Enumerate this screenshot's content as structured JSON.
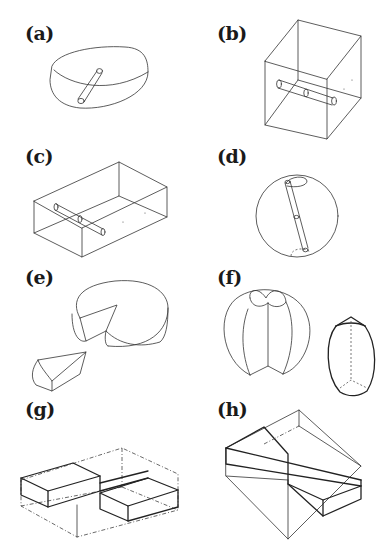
{
  "figure": {
    "panels": [
      {
        "id": "a",
        "label": "(a)",
        "description": "Disc-shaped (oblate) body with a short cylindrical rod embedded near the top surface"
      },
      {
        "id": "b",
        "label": "(b)",
        "description": "Cube with a two-segment cylindrical rod passing horizontally through the interior"
      },
      {
        "id": "c",
        "label": "(c)",
        "description": "Rectangular box with a two-segment cylindrical rod inside"
      },
      {
        "id": "d",
        "label": "(d)",
        "description": "Sphere with a two-segment cylindrical rod along a tilted diameter"
      },
      {
        "id": "e",
        "label": "(e)",
        "description": "Cheese wheel with a wedge removed, and the detached wedge"
      },
      {
        "id": "f",
        "label": "(f)",
        "description": "Sphere with a wedge-shaped sector cut, and a barrel-shaped solid"
      },
      {
        "id": "g",
        "label": "(g)",
        "description": "Rectangular box containing two offset stepped blocks, with dash-dot hidden edges"
      },
      {
        "id": "h",
        "label": "(h)",
        "description": "Rectangular box with a diagonal stepped cut section"
      }
    ]
  }
}
